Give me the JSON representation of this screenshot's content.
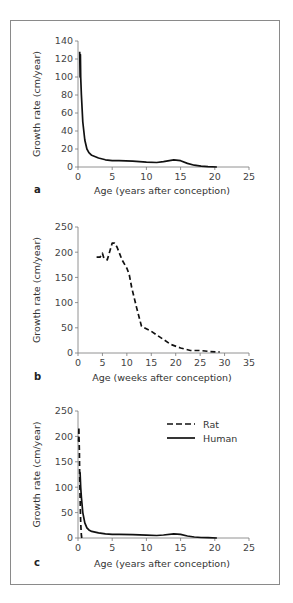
{
  "chart_data": [
    {
      "panel": "a",
      "type": "line",
      "title": "",
      "xlabel": "Age (years after conception)",
      "ylabel": "Growth rate (cm/year)",
      "xlim": [
        0,
        25
      ],
      "ylim": [
        0,
        140
      ],
      "xticks": [
        0,
        5,
        10,
        15,
        20,
        25
      ],
      "yticks": [
        0,
        20,
        40,
        60,
        80,
        100,
        120,
        140
      ],
      "grid": false,
      "series": [
        {
          "name": "Human",
          "style": "solid",
          "x": [
            0.25,
            0.3,
            0.35,
            0.4,
            0.5,
            0.7,
            1.0,
            1.3,
            1.6,
            2.0,
            3.0,
            4.0,
            5.0,
            6.0,
            8.0,
            10.0,
            11.5,
            12.5,
            14.0,
            15.0,
            16.0,
            17.0,
            18.0,
            19.0,
            20.3
          ],
          "y": [
            128,
            100,
            125,
            100,
            80,
            50,
            30,
            20,
            16,
            13,
            10,
            8,
            7,
            7,
            6.5,
            5.5,
            5,
            6,
            8,
            7,
            4,
            2,
            1,
            0.5,
            0
          ]
        }
      ]
    },
    {
      "panel": "b",
      "type": "line",
      "title": "",
      "xlabel": "Age (weeks after conception)",
      "ylabel": "Growth rate (cm/year)",
      "xlim": [
        0,
        35
      ],
      "ylim": [
        0,
        250
      ],
      "xticks": [
        0,
        5,
        10,
        15,
        20,
        25,
        30,
        35
      ],
      "yticks": [
        0,
        50,
        100,
        150,
        200,
        250
      ],
      "grid": false,
      "series": [
        {
          "name": "Rat",
          "style": "dashed",
          "x": [
            3.8,
            4.5,
            5.0,
            5.3,
            6.0,
            7.0,
            7.5,
            8.0,
            9.0,
            10.0,
            10.5,
            11.0,
            12.0,
            13.0,
            15.0,
            17.0,
            19.0,
            21.0,
            23.0,
            25.0,
            27.0,
            29.0
          ],
          "y": [
            190,
            190,
            198,
            188,
            185,
            218,
            218,
            210,
            185,
            168,
            155,
            130,
            90,
            53,
            43,
            30,
            17,
            10,
            5,
            5,
            3,
            2
          ]
        }
      ]
    },
    {
      "panel": "c",
      "type": "line",
      "title": "",
      "xlabel": "Age (years after conception)",
      "ylabel": "Growth rate (cm/year)",
      "xlim": [
        0,
        25
      ],
      "ylim": [
        0,
        250
      ],
      "xticks": [
        0,
        5,
        10,
        15,
        20,
        25
      ],
      "yticks": [
        0,
        50,
        100,
        150,
        200,
        250
      ],
      "grid": false,
      "legend": {
        "position": "upper right",
        "entries": [
          "Rat",
          "Human"
        ]
      },
      "series": [
        {
          "name": "Rat",
          "style": "dashed",
          "x": [
            0.07,
            0.1,
            0.13,
            0.15,
            0.2,
            0.25,
            0.3,
            0.35,
            0.4,
            0.45,
            0.5,
            0.56
          ],
          "y": [
            190,
            200,
            218,
            200,
            170,
            120,
            80,
            53,
            30,
            15,
            5,
            0
          ]
        },
        {
          "name": "Human",
          "style": "solid",
          "x": [
            0.25,
            0.3,
            0.4,
            0.5,
            0.7,
            1.0,
            1.3,
            1.6,
            2.0,
            3.0,
            4.0,
            5.0,
            6.0,
            8.0,
            10.0,
            11.5,
            12.5,
            14.0,
            15.0,
            16.0,
            17.0,
            18.0,
            19.0,
            20.3
          ],
          "y": [
            130,
            128,
            100,
            80,
            50,
            30,
            20,
            16,
            13,
            10,
            8,
            7,
            7,
            6.5,
            5.5,
            5,
            6,
            8,
            7,
            4,
            2,
            1,
            0.5,
            0
          ]
        }
      ]
    }
  ],
  "labels": {
    "panel_a": "a",
    "panel_b": "b",
    "panel_c": "c",
    "legend_rat": "Rat",
    "legend_human": "Human"
  }
}
